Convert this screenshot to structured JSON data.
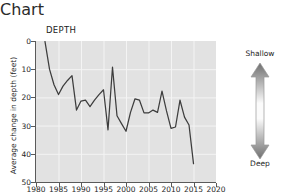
{
  "chart_data": {
    "type": "line",
    "title": "DEPTH",
    "xlabel": "Year",
    "ylabel": "Average change in depth (feet)",
    "xlim": [
      1980,
      2020
    ],
    "ylim": [
      0,
      50
    ],
    "y_inverted": true,
    "grid": true,
    "xticks": [
      1980,
      1985,
      1990,
      1995,
      2000,
      2005,
      2010,
      2015,
      2020
    ],
    "yticks": [
      0,
      10,
      20,
      30,
      40,
      50
    ],
    "series": [
      {
        "name": "Average change in depth",
        "color": "#3d3d3d",
        "x": [
          1982,
          1983,
          1984,
          1985,
          1986,
          1987,
          1988,
          1989,
          1990,
          1991,
          1992,
          1993,
          1994,
          1995,
          1996,
          1997,
          1998,
          1999,
          2000,
          2001,
          2002,
          2003,
          2004,
          2005,
          2006,
          2007,
          2008,
          2009,
          2010,
          2011,
          2012,
          2013,
          2014,
          2015
        ],
        "values": [
          0.2,
          10.0,
          15.5,
          19.0,
          16.0,
          14.0,
          12.3,
          24.5,
          21.3,
          21.0,
          23.3,
          21.0,
          19.0,
          17.3,
          31.5,
          9.3,
          26.5,
          29.3,
          32.0,
          25.3,
          20.5,
          21.0,
          25.5,
          25.5,
          24.5,
          25.3,
          17.8,
          24.8,
          31.0,
          30.5,
          21.0,
          27.0,
          29.8,
          43.5
        ]
      }
    ],
    "annotations": []
  },
  "legend": {
    "top_label": "Shallow",
    "bottom_label": "Deep",
    "arrow_icon": "double-headed-vertical-arrow",
    "gradient_top_color": "#6f6f6f",
    "gradient_mid_color": "#fafafa",
    "gradient_bottom_color": "#6f6f6f"
  },
  "colors": {
    "plot_background": "#e2e2e2",
    "gridline": "#f4f4f4",
    "axis": "#5a5a5a",
    "line": "#3d3d3d",
    "text": "#262626"
  }
}
